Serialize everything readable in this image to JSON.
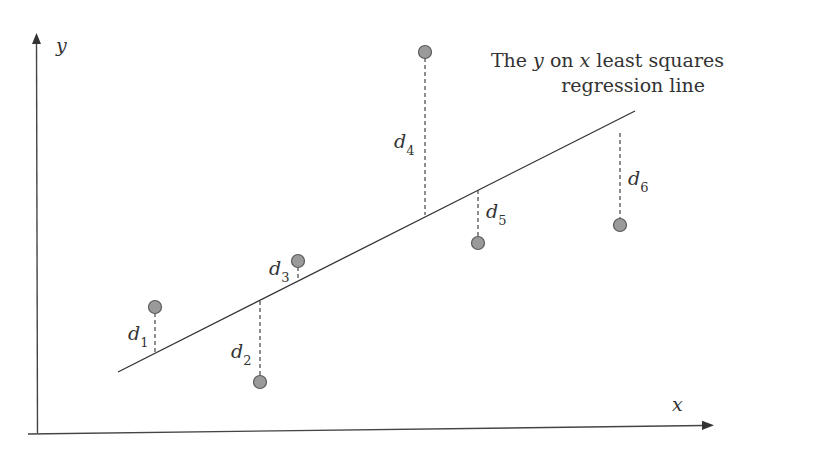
{
  "axes": {
    "x_label": "x",
    "y_label": "y"
  },
  "annotation": {
    "line1_prefix": "The ",
    "line1_y": "y",
    "line1_mid": " on ",
    "line1_x": "x",
    "line1_suffix": " least squares",
    "line2": "regression line"
  },
  "residual_labels": [
    {
      "letter": "d",
      "sub": "1"
    },
    {
      "letter": "d",
      "sub": "2"
    },
    {
      "letter": "d",
      "sub": "3"
    },
    {
      "letter": "d",
      "sub": "4"
    },
    {
      "letter": "d",
      "sub": "5"
    },
    {
      "letter": "d",
      "sub": "6"
    }
  ],
  "colors": {
    "point_fill": "#9a9a9a",
    "point_stroke": "#555555",
    "line": "#333333"
  }
}
